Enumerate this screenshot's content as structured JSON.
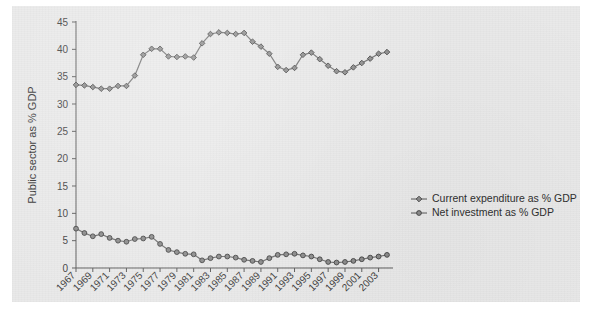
{
  "figure": {
    "background_color": "#e9e9e9",
    "page_color": "#ffffff"
  },
  "chart_data": {
    "type": "line",
    "title": "",
    "xlabel": "Year",
    "ylabel": "Public sector as % GDP",
    "xlim": [
      1967,
      2004
    ],
    "ylim": [
      0,
      45
    ],
    "yticks": [
      0,
      5,
      10,
      15,
      20,
      25,
      30,
      35,
      40,
      45
    ],
    "xticks": [
      1967,
      1969,
      1971,
      1973,
      1975,
      1977,
      1979,
      1981,
      1983,
      1985,
      1987,
      1989,
      1991,
      1993,
      1995,
      1997,
      1999,
      2001,
      2003
    ],
    "xtick_labels": [
      "1967",
      "1969",
      "1971",
      "1973",
      "1975",
      "1977",
      "1979",
      "1981",
      "1983",
      "1985",
      "1987",
      "1989",
      "1991",
      "1993",
      "1995",
      "1997",
      "1999",
      "2001",
      "2003"
    ],
    "grid": false,
    "legend_position": "right-middle",
    "x": [
      1967,
      1968,
      1969,
      1970,
      1971,
      1972,
      1973,
      1974,
      1975,
      1976,
      1977,
      1978,
      1979,
      1980,
      1981,
      1982,
      1983,
      1984,
      1985,
      1986,
      1987,
      1988,
      1989,
      1990,
      1991,
      1992,
      1993,
      1994,
      1995,
      1996,
      1997,
      1998,
      1999,
      2000,
      2001,
      2002,
      2003,
      2004
    ],
    "series": [
      {
        "name": "Current expenditure as % GDP",
        "marker": "diamond",
        "color": "#6d6d6d",
        "values": [
          33.5,
          33.4,
          33.1,
          32.8,
          32.8,
          33.3,
          33.3,
          35.2,
          39.0,
          40.1,
          40.1,
          38.7,
          38.6,
          38.7,
          38.5,
          41.1,
          42.8,
          43.1,
          43.0,
          42.8,
          43.0,
          41.4,
          40.5,
          39.2,
          36.8,
          36.2,
          36.6,
          39.0,
          39.4,
          38.2,
          37.0,
          36.0,
          35.8,
          36.7,
          37.5,
          38.3,
          39.2,
          39.5
        ]
      },
      {
        "name": "Net investment as % GDP",
        "marker": "circle",
        "color": "#6d6d6d",
        "values": [
          7.2,
          6.4,
          5.8,
          6.2,
          5.5,
          5.0,
          4.8,
          5.3,
          5.4,
          5.7,
          4.4,
          3.3,
          2.9,
          2.6,
          2.5,
          1.4,
          1.8,
          2.1,
          2.1,
          1.9,
          1.5,
          1.3,
          1.1,
          1.8,
          2.4,
          2.5,
          2.6,
          2.3,
          2.1,
          1.6,
          1.1,
          1.0,
          1.1,
          1.3,
          1.6,
          1.9,
          2.1,
          2.4
        ]
      }
    ],
    "legend": [
      {
        "label": "Current expenditure as % GDP",
        "marker": "diamond"
      },
      {
        "label": "Net investment as % GDP",
        "marker": "circle"
      }
    ]
  }
}
